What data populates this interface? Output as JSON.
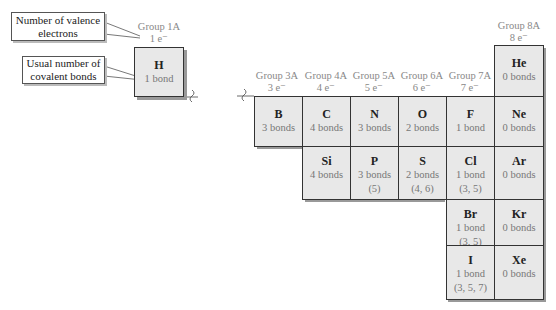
{
  "callouts": {
    "valence": "Number of valence electrons",
    "bonds": "Usual number of covalent bonds"
  },
  "groups": [
    {
      "name": "Group 1A",
      "electrons": "1 e⁻"
    },
    {
      "name": "Group 3A",
      "electrons": "3 e⁻"
    },
    {
      "name": "Group 4A",
      "electrons": "4 e⁻"
    },
    {
      "name": "Group 5A",
      "electrons": "5 e⁻"
    },
    {
      "name": "Group 6A",
      "electrons": "6 e⁻"
    },
    {
      "name": "Group 7A",
      "electrons": "7 e⁻"
    },
    {
      "name": "Group 8A",
      "electrons": "8 e⁻"
    }
  ],
  "elements": {
    "H": {
      "symbol": "H",
      "bonds": "1 bond",
      "alt": ""
    },
    "He": {
      "symbol": "He",
      "bonds": "0 bonds",
      "alt": ""
    },
    "B": {
      "symbol": "B",
      "bonds": "3 bonds",
      "alt": ""
    },
    "C": {
      "symbol": "C",
      "bonds": "4 bonds",
      "alt": ""
    },
    "N": {
      "symbol": "N",
      "bonds": "3 bonds",
      "alt": ""
    },
    "O": {
      "symbol": "O",
      "bonds": "2 bonds",
      "alt": ""
    },
    "F": {
      "symbol": "F",
      "bonds": "1 bond",
      "alt": ""
    },
    "Ne": {
      "symbol": "Ne",
      "bonds": "0 bonds",
      "alt": ""
    },
    "Si": {
      "symbol": "Si",
      "bonds": "4 bonds",
      "alt": ""
    },
    "P": {
      "symbol": "P",
      "bonds": "3 bonds",
      "alt": "(5)"
    },
    "S": {
      "symbol": "S",
      "bonds": "2 bonds",
      "alt": "(4, 6)"
    },
    "Cl": {
      "symbol": "Cl",
      "bonds": "1 bond",
      "alt": "(3, 5)"
    },
    "Ar": {
      "symbol": "Ar",
      "bonds": "0 bonds",
      "alt": ""
    },
    "Br": {
      "symbol": "Br",
      "bonds": "1 bond",
      "alt": "(3, 5)"
    },
    "Kr": {
      "symbol": "Kr",
      "bonds": "0 bonds",
      "alt": ""
    },
    "I": {
      "symbol": "I",
      "bonds": "1 bond",
      "alt": "(3, 5, 7)"
    },
    "Xe": {
      "symbol": "Xe",
      "bonds": "0 bonds",
      "alt": ""
    }
  },
  "break_symbol": "≁"
}
